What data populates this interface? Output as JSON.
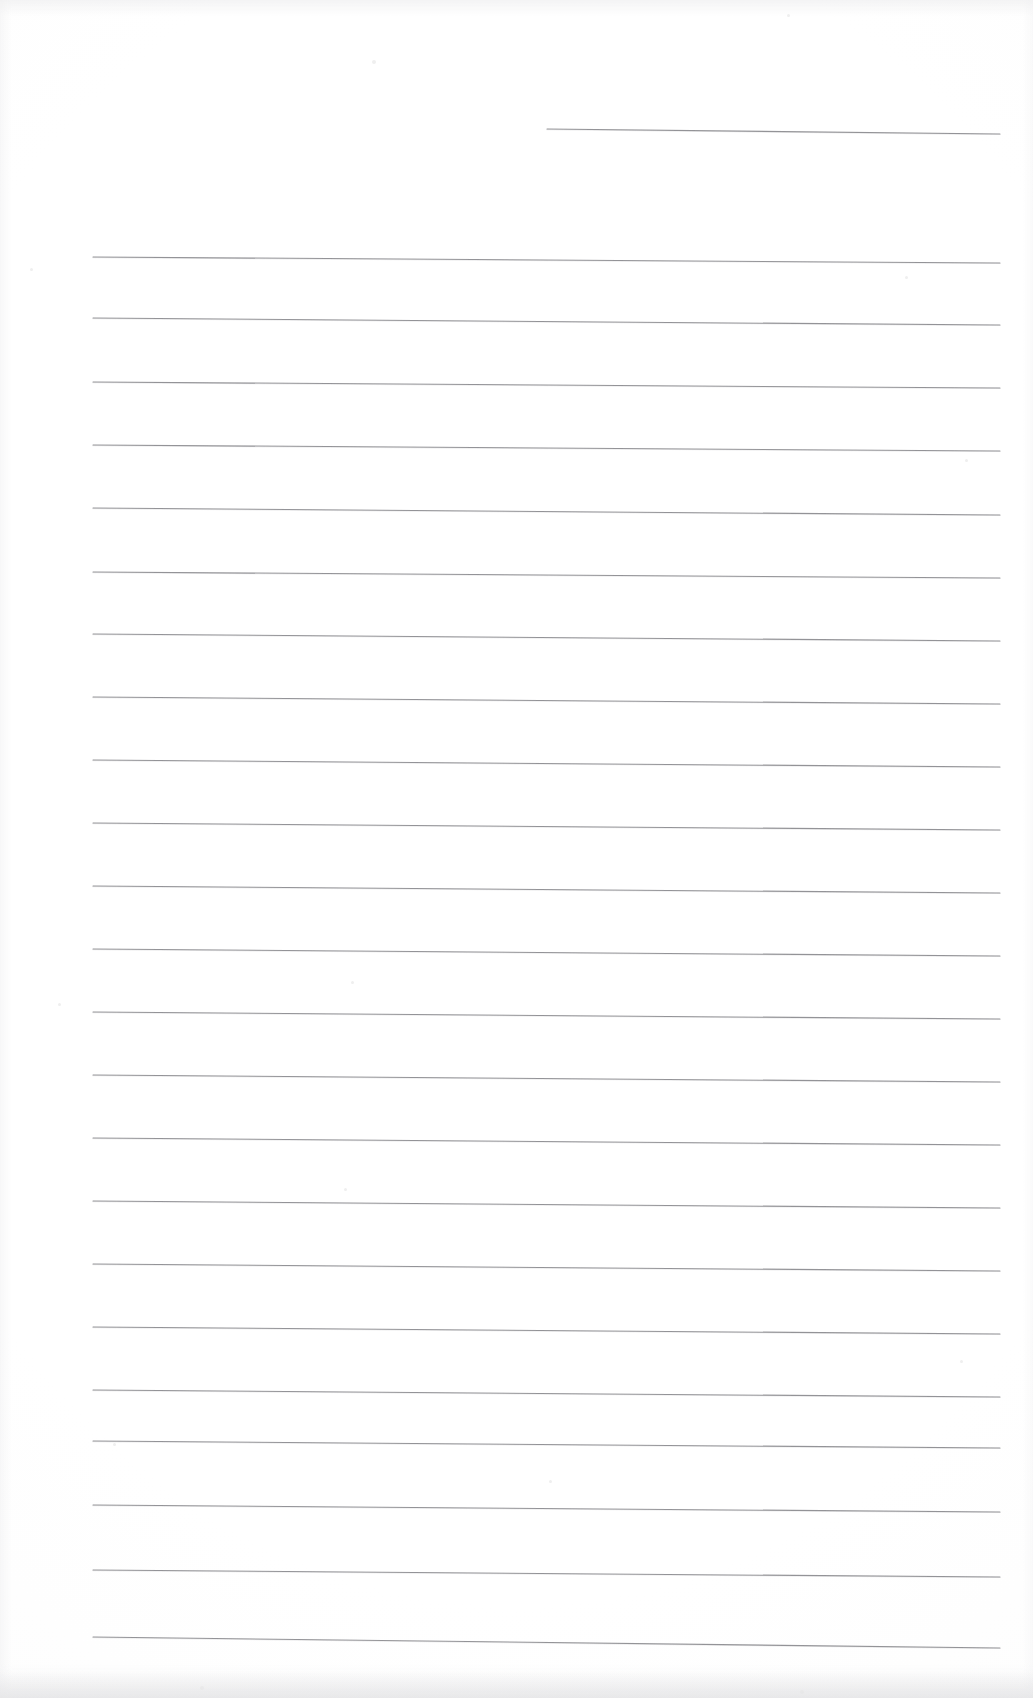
{
  "document": {
    "kind": "scanned-lined-paper",
    "title": "Blank ruled notepad page",
    "page_width": 1033,
    "page_height": 1698,
    "background_color": "#ffffff",
    "rule_color": "#8c8c90",
    "rule_thickness_px": 1,
    "content_text": "",
    "handwriting": "none",
    "notes": "Scanned blank writing-paper sheet. No text, headings, page numbers or marks are present."
  },
  "ruling": {
    "left_margin_x": 93,
    "right_end_x": 1000,
    "line_spacing_px": 63,
    "first_full_line_y": 257,
    "slope_drop_px": 6,
    "partial_top_line": {
      "label": "partial-top-rule",
      "start_x": 547,
      "end_x": 1000,
      "y_left": 129,
      "y_right": 134
    },
    "full_lines": [
      {
        "index": 1,
        "y_left": 257,
        "y_right": 263
      },
      {
        "index": 2,
        "y_left": 318,
        "y_right": 325
      },
      {
        "index": 3,
        "y_left": 382,
        "y_right": 388
      },
      {
        "index": 4,
        "y_left": 445,
        "y_right": 451
      },
      {
        "index": 5,
        "y_left": 508,
        "y_right": 515
      },
      {
        "index": 6,
        "y_left": 572,
        "y_right": 578
      },
      {
        "index": 7,
        "y_left": 634,
        "y_right": 641
      },
      {
        "index": 8,
        "y_left": 697,
        "y_right": 704
      },
      {
        "index": 9,
        "y_left": 760,
        "y_right": 767
      },
      {
        "index": 10,
        "y_left": 823,
        "y_right": 830
      },
      {
        "index": 11,
        "y_left": 886,
        "y_right": 893
      },
      {
        "index": 12,
        "y_left": 949,
        "y_right": 956
      },
      {
        "index": 13,
        "y_left": 1012,
        "y_right": 1019
      },
      {
        "index": 14,
        "y_left": 1075,
        "y_right": 1082
      },
      {
        "index": 15,
        "y_left": 1138,
        "y_right": 1145
      },
      {
        "index": 16,
        "y_left": 1201,
        "y_right": 1208
      },
      {
        "index": 17,
        "y_left": 1264,
        "y_right": 1271
      },
      {
        "index": 18,
        "y_left": 1327,
        "y_right": 1334
      },
      {
        "index": 19,
        "y_left": 1390,
        "y_right": 1397
      },
      {
        "index": 20,
        "y_left": 1441,
        "y_right": 1448
      },
      {
        "index": 21,
        "y_left": 1505,
        "y_right": 1512
      },
      {
        "index": 22,
        "y_left": 1570,
        "y_right": 1577
      },
      {
        "index": 23,
        "y_left": 1637,
        "y_right": 1648
      }
    ],
    "total_full_lines": 23
  },
  "specks": [
    {
      "x": 30,
      "y": 268,
      "size": 3
    },
    {
      "x": 372,
      "y": 60,
      "size": 4
    },
    {
      "x": 787,
      "y": 14,
      "size": 3
    },
    {
      "x": 905,
      "y": 276,
      "size": 3
    },
    {
      "x": 965,
      "y": 459,
      "size": 3
    },
    {
      "x": 58,
      "y": 1003,
      "size": 3
    },
    {
      "x": 351,
      "y": 981,
      "size": 3
    },
    {
      "x": 344,
      "y": 1188,
      "size": 3
    },
    {
      "x": 960,
      "y": 1360,
      "size": 3
    },
    {
      "x": 113,
      "y": 1443,
      "size": 3
    },
    {
      "x": 549,
      "y": 1480,
      "size": 3
    },
    {
      "x": 800,
      "y": 1690,
      "size": 4
    },
    {
      "x": 200,
      "y": 1686,
      "size": 4
    }
  ]
}
